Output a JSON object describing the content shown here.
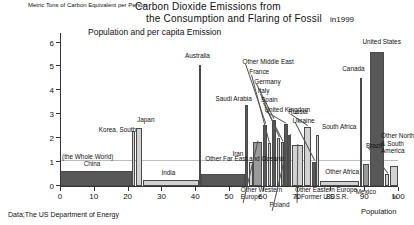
{
  "header": {
    "title_line1": "Carbon Dioxide Emissions from",
    "title_line2": "the Consumption and Flaring of Fossil",
    "year": "in1999",
    "subtitle": "Population and per capita Emission"
  },
  "footer": {
    "source": "Data;The US Department of Energy"
  },
  "chart_data": {
    "type": "bar",
    "title": "Carbon Dioxide Emissions from the Consumption and Flaring of Fossil in1999",
    "subtitle": "Population and per capita Emission",
    "xlabel": "Population",
    "xunit": "%",
    "ylabel": "Metric Tons of Carbon Equivalent per Person",
    "xlim": [
      0,
      100
    ],
    "ylim": [
      0,
      6.4
    ],
    "xticks": [
      0,
      10,
      20,
      30,
      40,
      50,
      60,
      70,
      80,
      90,
      100
    ],
    "yticks": [
      0,
      1,
      2,
      3,
      4,
      5,
      6
    ],
    "grid": false,
    "reference_line": {
      "label": "(the Whole World)",
      "value": 1.05
    },
    "note": "Bar width = share of world population (%); bar height = per capita emission.",
    "bars": [
      {
        "name": "China",
        "x0": 0.0,
        "x1": 21.2,
        "value": 0.62,
        "shade": "dark",
        "label": "China",
        "label_x": 7.0,
        "label_y": 0.78,
        "leader": false
      },
      {
        "name": "Korea, South",
        "x0": 21.4,
        "x1": 22.2,
        "value": 2.3,
        "shade": "light",
        "label": "Korea, South",
        "label_x": 11.5,
        "label_y": 2.22,
        "leader": false
      },
      {
        "name": "Japan",
        "x0": 22.4,
        "x1": 24.4,
        "value": 2.42,
        "shade": "light",
        "label": "Japan",
        "label_x": 22.8,
        "label_y": 2.62,
        "leader": false
      },
      {
        "name": "India",
        "x0": 24.6,
        "x1": 41.0,
        "value": 0.24,
        "shade": "light",
        "label": "India",
        "label_x": 30.0,
        "label_y": 0.4,
        "leader": false
      },
      {
        "name": "Australia",
        "x0": 41.1,
        "x1": 41.6,
        "value": 5.05,
        "shade": "dark",
        "label": "Australia",
        "label_x": 37.0,
        "label_y": 5.3,
        "leader": false
      },
      {
        "name": "Other Far East and Oceania",
        "x0": 41.7,
        "x1": 54.6,
        "value": 0.5,
        "shade": "dark",
        "label": "Other Far East and Oceania",
        "label_x": 43.0,
        "label_y": 0.98,
        "leader": false
      },
      {
        "name": "Saudi Arabia",
        "x0": 54.8,
        "x1": 55.6,
        "value": 3.4,
        "shade": "dark",
        "label": "Saudi Arabia",
        "label_x": 46.0,
        "label_y": 3.52,
        "leader": false
      },
      {
        "name": "Iran",
        "x0": 55.8,
        "x1": 57.0,
        "value": 1.0,
        "shade": "light",
        "label": "Iran",
        "label_x": 51.0,
        "label_y": 1.18,
        "leader": false
      },
      {
        "name": "Other Western Europe",
        "x0": 57.2,
        "x1": 59.8,
        "value": 1.85,
        "shade": "mid",
        "label": "Other Western\nEurope",
        "label_x": 53.5,
        "label_y": -0.62,
        "leader": true,
        "leader_to_x": 58.5
      },
      {
        "name": "Other Middle East",
        "x0": 60.0,
        "x1": 61.2,
        "value": 2.55,
        "shade": "dark",
        "label": "Other Middle East",
        "label_x": 54.0,
        "label_y": 5.05,
        "leader": true,
        "leader_to_x": 60.6
      },
      {
        "name": "France",
        "x0": 61.4,
        "x1": 62.4,
        "value": 1.78,
        "shade": "light",
        "label": "France",
        "label_x": 56.0,
        "label_y": 4.62,
        "leader": true,
        "leader_to_x": 61.9
      },
      {
        "name": "Germany",
        "x0": 62.6,
        "x1": 64.0,
        "value": 2.75,
        "shade": "dark",
        "label": "Germany",
        "label_x": 57.5,
        "label_y": 4.22,
        "leader": true,
        "leader_to_x": 63.3
      },
      {
        "name": "Italy",
        "x0": 64.2,
        "x1": 65.2,
        "value": 2.0,
        "shade": "light",
        "label": "Italy",
        "label_x": 58.5,
        "label_y": 3.82,
        "leader": true,
        "leader_to_x": 64.7
      },
      {
        "name": "Spain",
        "x0": 65.4,
        "x1": 66.2,
        "value": 1.85,
        "shade": "mid",
        "label": "Spain",
        "label_x": 59.5,
        "label_y": 3.44,
        "leader": true,
        "leader_to_x": 65.8
      },
      {
        "name": "United Kingdom",
        "x0": 66.4,
        "x1": 67.4,
        "value": 2.58,
        "shade": "dark",
        "label": "United Kingdom",
        "label_x": 60.5,
        "label_y": 3.06,
        "leader": true,
        "leader_to_x": 66.9
      },
      {
        "name": "Poland",
        "x0": 67.6,
        "x1": 68.4,
        "value": 2.12,
        "shade": "dark",
        "label": "Poland",
        "label_x": 62.0,
        "label_y": -0.95,
        "leader": true,
        "leader_to_x": 68.0
      },
      {
        "name": "Other Eastern Europe & Former U.S.S.R.",
        "x0": 68.6,
        "x1": 72.0,
        "value": 1.72,
        "shade": "light",
        "label": "Other Eastern Europe\n& Former U.S.S.R.",
        "label_x": 69.5,
        "label_y": -0.62,
        "leader": true,
        "leader_to_x": 70.3
      },
      {
        "name": "Russia",
        "x0": 72.2,
        "x1": 74.4,
        "value": 2.45,
        "shade": "light",
        "label": "Russia",
        "label_x": 67.5,
        "label_y": 2.95,
        "leader": true,
        "leader_to_x": 73.3
      },
      {
        "name": "Ukraine",
        "x0": 74.6,
        "x1": 75.6,
        "value": 1.0,
        "shade": "dark",
        "label": "Ukraine",
        "label_x": 68.8,
        "label_y": 2.58,
        "leader": true,
        "leader_to_x": 75.1
      },
      {
        "name": "South Africa",
        "x0": 75.8,
        "x1": 76.6,
        "value": 2.12,
        "shade": "light",
        "label": "South Africa",
        "label_x": 77.5,
        "label_y": 2.32,
        "leader": false
      },
      {
        "name": "Other Africa",
        "x0": 76.8,
        "x1": 88.6,
        "value": 0.2,
        "shade": "light",
        "label": "Other Africa",
        "label_x": 78.5,
        "label_y": 0.44,
        "leader": false
      },
      {
        "name": "Canada",
        "x0": 88.8,
        "x1": 89.4,
        "value": 4.52,
        "shade": "light",
        "label": "Canada",
        "label_x": 83.5,
        "label_y": 4.75,
        "leader": false
      },
      {
        "name": "Mexico",
        "x0": 89.6,
        "x1": 91.4,
        "value": 0.92,
        "shade": "mid",
        "label": "Mexico",
        "label_x": 87.5,
        "label_y": -0.38,
        "leader": false
      },
      {
        "name": "United States",
        "x0": 91.6,
        "x1": 96.0,
        "value": 5.62,
        "shade": "dark",
        "label": "United States",
        "label_x": 89.5,
        "label_y": 5.88,
        "leader": false
      },
      {
        "name": "Brazil",
        "x0": 96.2,
        "x1": 97.4,
        "value": 0.5,
        "shade": "light",
        "label": "Brazil",
        "label_x": 90.5,
        "label_y": 1.55,
        "leader": true,
        "leader_to_x": 96.8
      },
      {
        "name": "Other North & South America",
        "x0": 97.6,
        "x1": 100.0,
        "value": 0.82,
        "shade": "light",
        "label": "Other North\n& South\nAmerica",
        "label_x": 95.0,
        "label_y": 1.32,
        "leader": false
      }
    ]
  }
}
